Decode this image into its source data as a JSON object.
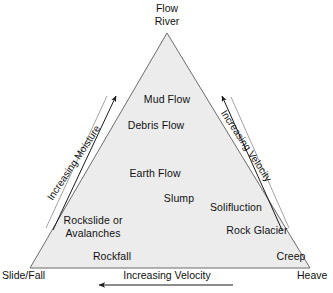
{
  "diagram": {
    "title_apex": {
      "line1": "Flow",
      "line2": "River"
    },
    "corners": {
      "bottom_left": "Slide/Fall",
      "bottom_right": "Heave"
    },
    "axes": {
      "left_edge": "Increasing Moisture",
      "right_edge": "Increasing Velocity",
      "bottom": "Increasing Velocity"
    },
    "items": [
      {
        "label": "Mud Flow"
      },
      {
        "label": "Debris Flow"
      },
      {
        "label": "Earth Flow"
      },
      {
        "label": "Slump"
      },
      {
        "label": "Solifluction"
      },
      {
        "label": "Rockslide or"
      },
      {
        "label": "Avalanches"
      },
      {
        "label": "Rock Glacier"
      },
      {
        "label": "Rockfall"
      },
      {
        "label": "Creep"
      }
    ],
    "colors": {
      "fill": "#ececec",
      "stroke": "#666666",
      "text": "#111111",
      "background": "#ffffff"
    }
  }
}
